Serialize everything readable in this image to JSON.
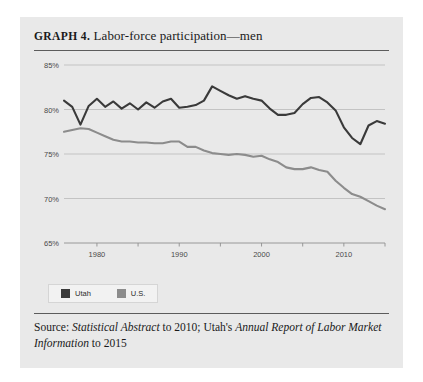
{
  "card": {
    "title_number": "GRAPH 4.",
    "title_text": "Labor-force participation—men",
    "source_prefix": "Source: ",
    "source_italic_1": "Statistical Abstract",
    "source_mid": " to 2010; Utah's ",
    "source_italic_2": "Annual Report of Labor Market Information",
    "source_suffix": " to 2015"
  },
  "legend": {
    "position": "below-axis-left",
    "items": [
      {
        "label": "Utah",
        "color": "#3a3a3a"
      },
      {
        "label": "U.S.",
        "color": "#8c8c8c"
      }
    ]
  },
  "chart_data": {
    "type": "line",
    "title": "Labor-force participation—men",
    "xlabel": "",
    "ylabel": "",
    "xlim": [
      1976,
      2015
    ],
    "ylim": [
      65,
      85
    ],
    "grid": true,
    "grid_axis": "y",
    "yticks": [
      65,
      70,
      75,
      80,
      85
    ],
    "ytick_labels": [
      "65%",
      "70%",
      "75%",
      "80%",
      "85%"
    ],
    "xticks_major": [
      1980,
      1990,
      2000,
      2010
    ],
    "xtick_labels": [
      "1980",
      "1990",
      "2000",
      "2010"
    ],
    "xticks_minor": [
      1980,
      1985,
      1990,
      1995,
      2000,
      2005,
      2010,
      2015
    ],
    "x": [
      1976,
      1977,
      1978,
      1979,
      1980,
      1981,
      1982,
      1983,
      1984,
      1985,
      1986,
      1987,
      1988,
      1989,
      1990,
      1991,
      1992,
      1993,
      1994,
      1995,
      1996,
      1997,
      1998,
      1999,
      2000,
      2001,
      2002,
      2003,
      2004,
      2005,
      2006,
      2007,
      2008,
      2009,
      2010,
      2011,
      2012,
      2013,
      2014,
      2015
    ],
    "series": [
      {
        "name": "Utah",
        "color": "#3a3a3a",
        "width": 2.1,
        "values": [
          81.0,
          80.3,
          78.3,
          80.4,
          81.2,
          80.3,
          80.9,
          80.1,
          80.7,
          80.0,
          80.8,
          80.2,
          80.9,
          81.2,
          80.2,
          80.3,
          80.5,
          81.0,
          82.6,
          82.1,
          81.6,
          81.2,
          81.5,
          81.2,
          81.0,
          80.1,
          79.4,
          79.4,
          79.6,
          80.6,
          81.3,
          81.4,
          80.8,
          79.9,
          78.0,
          76.8,
          76.1,
          78.2,
          78.7,
          78.4
        ]
      },
      {
        "name": "U.S.",
        "color": "#8c8c8c",
        "width": 2.1,
        "values": [
          77.5,
          77.7,
          77.9,
          77.8,
          77.4,
          77.0,
          76.6,
          76.4,
          76.4,
          76.3,
          76.3,
          76.2,
          76.2,
          76.4,
          76.4,
          75.8,
          75.8,
          75.4,
          75.1,
          75.0,
          74.9,
          75.0,
          74.9,
          74.7,
          74.8,
          74.4,
          74.1,
          73.5,
          73.3,
          73.3,
          73.5,
          73.2,
          73.0,
          72.0,
          71.2,
          70.5,
          70.2,
          69.7,
          69.2,
          68.8
        ]
      }
    ]
  }
}
